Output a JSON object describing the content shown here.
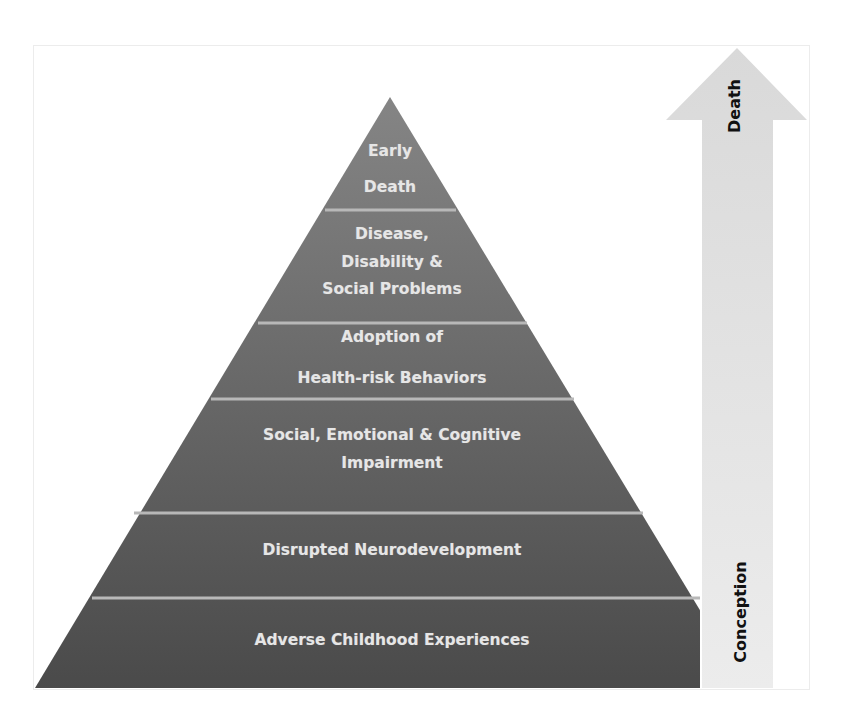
{
  "diagram": {
    "type": "pyramid",
    "layers_bottom_to_top": [
      {
        "id": "ace",
        "lines": [
          "Adverse Childhood Experiences"
        ]
      },
      {
        "id": "neuro",
        "lines": [
          "Disrupted Neurodevelopment"
        ]
      },
      {
        "id": "impair",
        "lines": [
          "Social, Emotional & Cognitive",
          "Impairment"
        ]
      },
      {
        "id": "risk",
        "lines": [
          "Adoption of",
          "Health-risk Behaviors"
        ]
      },
      {
        "id": "disease",
        "lines": [
          "Disease,",
          "Disability &",
          "Social Problems"
        ]
      },
      {
        "id": "death",
        "lines": [
          "Early",
          "Death"
        ]
      }
    ],
    "arrow": {
      "direction": "up",
      "top_label": "Death",
      "bottom_label": "Conception"
    },
    "colors": {
      "pyramid_top": "#858585",
      "pyramid_bottom": "#4a4a4a",
      "separator": "#b8b8b8",
      "arrow_fill": "#e4e4e4",
      "layer_text": "#e6e6e6",
      "arrow_text": "#111111"
    }
  }
}
